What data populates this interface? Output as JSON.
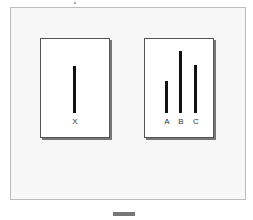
{
  "diagram": {
    "standard_card": {
      "lines": [
        {
          "label": "X",
          "relative_length": 0.75
        }
      ]
    },
    "comparison_card": {
      "lines": [
        {
          "label": "A",
          "relative_length": 0.6
        },
        {
          "label": "B",
          "relative_length": 0.85
        },
        {
          "label": "C",
          "relative_length": 0.75
        }
      ]
    },
    "colors": {
      "line": "#111111",
      "card_border": "#555555",
      "frame_bg": "#f7f7f7"
    }
  }
}
